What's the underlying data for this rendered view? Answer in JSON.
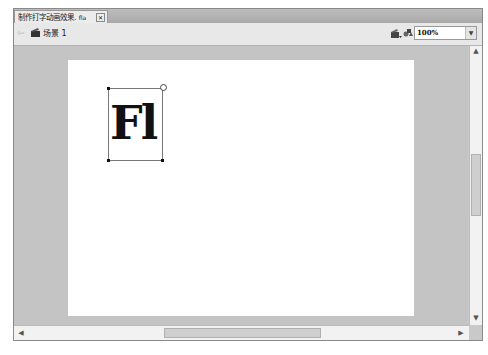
{
  "tab": {
    "title": "制作打字动画效果.",
    "suffix": "fla",
    "close": "✕"
  },
  "toolbar": {
    "back_arrow": "⇦",
    "scene_icon": "scene-icon",
    "scene_label": "场景 1",
    "edit_symbols_icon": "edit-symbols-icon",
    "edit_scene_icon": "edit-scene-icon",
    "zoom_value": "100%",
    "zoom_dropdown": "▼"
  },
  "stage": {
    "text_field_content": "Fl",
    "background": "#ffffff"
  },
  "scrollbars": {
    "up": "▲",
    "down": "▼",
    "left": "◀",
    "right": "▶"
  },
  "colors": {
    "workarea": "#c4c4c4",
    "toolbar": "#e8e8e8"
  }
}
